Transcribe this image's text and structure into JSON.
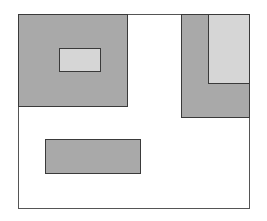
{
  "diagram": {
    "frame": {
      "x": 18,
      "y": 14,
      "w": 232,
      "h": 195,
      "border": "#555555",
      "fill": "#ffffff"
    },
    "colors": {
      "dark": "#a9a9a9",
      "light": "#d6d6d6",
      "edge": "#3a3a3a"
    },
    "rects": [
      {
        "id": "top-left-block",
        "x": 18,
        "y": 14,
        "w": 110,
        "h": 93,
        "tone": "dark"
      },
      {
        "id": "top-left-inner",
        "x": 59,
        "y": 48,
        "w": 42,
        "h": 24,
        "tone": "light"
      },
      {
        "id": "top-right-block",
        "x": 181,
        "y": 14,
        "w": 69,
        "h": 104,
        "tone": "dark"
      },
      {
        "id": "top-right-inner",
        "x": 208,
        "y": 14,
        "w": 42,
        "h": 70,
        "tone": "light"
      },
      {
        "id": "bottom-block",
        "x": 45,
        "y": 139,
        "w": 96,
        "h": 35,
        "tone": "dark"
      }
    ]
  }
}
